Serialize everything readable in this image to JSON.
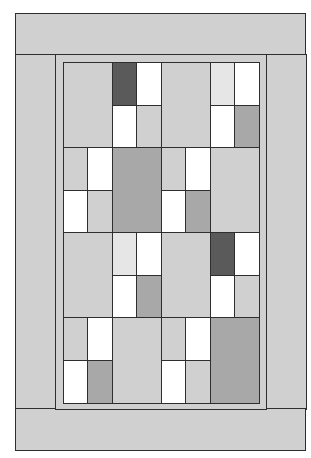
{
  "diagram": {
    "type": "quilt-pattern",
    "colors": {
      "light": "#d0d0d0",
      "very_light": "#e6e6e6",
      "medium": "#a8a8a8",
      "dark": "#5a5a5a",
      "white": "#ffffff",
      "outline": "#2e2e2e"
    },
    "borders": {
      "outer": "light",
      "inner_frame": "light"
    },
    "grid": {
      "rows": 4,
      "blocks_per_row": 2,
      "blocks": [
        [
          {
            "large": "light",
            "large_side": "left",
            "patch": [
              [
                "dark",
                "white"
              ],
              [
                "white",
                "light"
              ]
            ]
          },
          {
            "large": "light",
            "large_side": "left",
            "patch": [
              [
                "very_light",
                "white"
              ],
              [
                "white",
                "medium"
              ]
            ]
          }
        ],
        [
          {
            "large": "medium",
            "large_side": "right",
            "patch": [
              [
                "light",
                "white"
              ],
              [
                "white",
                "light"
              ]
            ]
          },
          {
            "large": "light",
            "large_side": "right",
            "patch": [
              [
                "light",
                "white"
              ],
              [
                "white",
                "medium"
              ]
            ]
          }
        ],
        [
          {
            "large": "light",
            "large_side": "left",
            "patch": [
              [
                "very_light",
                "white"
              ],
              [
                "white",
                "medium"
              ]
            ]
          },
          {
            "large": "light",
            "large_side": "left",
            "patch": [
              [
                "dark",
                "white"
              ],
              [
                "white",
                "light"
              ]
            ]
          }
        ],
        [
          {
            "large": "light",
            "large_side": "right",
            "patch": [
              [
                "light",
                "white"
              ],
              [
                "white",
                "medium"
              ]
            ]
          },
          {
            "large": "medium",
            "large_side": "right",
            "patch": [
              [
                "light",
                "white"
              ],
              [
                "white",
                "light"
              ]
            ]
          }
        ]
      ]
    }
  }
}
